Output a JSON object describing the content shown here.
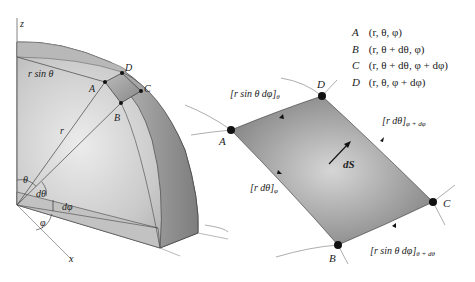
{
  "figure": {
    "left_panel": {
      "axes": {
        "z_label": "z",
        "x_label": "x"
      },
      "labels": {
        "r_sin_theta": "r sin θ",
        "r": "r",
        "theta": "θ",
        "d_theta": "dθ",
        "d_phi": "dφ",
        "phi": "φ"
      },
      "points": {
        "A": "A",
        "B": "B",
        "C": "C",
        "D": "D"
      }
    },
    "right_panel": {
      "points": {
        "A": "A",
        "B": "B",
        "C": "C",
        "D": "D"
      },
      "edge_labels": {
        "top": "[r sin θ dφ]",
        "top_sub": "θ",
        "right": "[r dθ]",
        "right_sub": "φ + dφ",
        "left": "[r dθ]",
        "left_sub": "φ",
        "bottom": "[r sin θ dφ]",
        "bottom_sub": "θ + dθ"
      },
      "vector_label": "dS"
    },
    "legend": [
      {
        "point": "A",
        "coords": "(r, θ, φ)"
      },
      {
        "point": "B",
        "coords": "(r, θ + dθ, φ)"
      },
      {
        "point": "C",
        "coords": "(r, θ + dθ, φ + dφ)"
      },
      {
        "point": "D",
        "coords": "(r, θ, φ + dφ)"
      }
    ],
    "colors": {
      "surface_light": "#e4e4e4",
      "surface_mid": "#bdbdbd",
      "surface_dark": "#8a8a8a",
      "patch": "#9a9a9a",
      "line": "#333333",
      "axis": "#555555"
    }
  }
}
